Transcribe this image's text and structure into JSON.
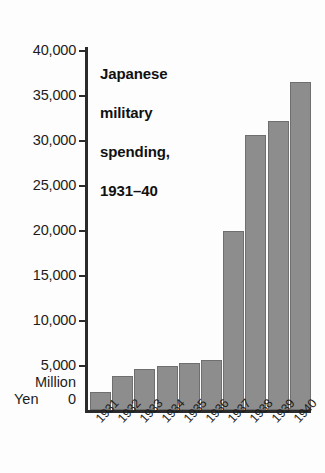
{
  "chart_data": {
    "type": "bar",
    "title": "Japanese military spending, 1931–40",
    "title_lines": [
      "Japanese",
      "military",
      "spending,",
      "1931–40"
    ],
    "xlabel": "",
    "ylabel": "Million Yen",
    "ylabel_lines": [
      "Million",
      "Yen"
    ],
    "categories": [
      "1931",
      "1932",
      "1933",
      "1934",
      "1935",
      "1936",
      "1937",
      "1938",
      "1939",
      "1940"
    ],
    "values": [
      2000,
      3800,
      4600,
      4900,
      5200,
      5600,
      19900,
      30600,
      32100,
      36400
    ],
    "series": [
      {
        "name": "Japanese military spending",
        "values": [
          2000,
          3800,
          4600,
          4900,
          5200,
          5600,
          19900,
          30600,
          32100,
          36400
        ]
      }
    ],
    "ylim": [
      0,
      40000
    ],
    "y_ticks": [
      0,
      5000,
      10000,
      15000,
      20000,
      25000,
      30000,
      35000,
      40000
    ],
    "y_tick_labels": [
      "0",
      "5,000",
      "10,000",
      "15,000",
      "20,000",
      "25,000",
      "30,000",
      "35,000",
      "40,000"
    ],
    "grid": false,
    "legend": null,
    "bar_color": "#8d8d8d",
    "bar_border_color": "#6f6f6f",
    "axis_color": "#2b2b2b",
    "text_color": "#1c1c1c",
    "background_color": "#fdfdfd"
  },
  "axis": {
    "tick_0": "0",
    "tick_5000": "5,000",
    "tick_10000": "10,000",
    "tick_15000": "15,000",
    "tick_20000": "20,000",
    "tick_25000": "25,000",
    "tick_30000": "30,000",
    "tick_35000": "35,000",
    "tick_40000": "40,000",
    "unit_line1": "Million",
    "unit_line2": "Yen",
    "zero_label": "0"
  },
  "title": {
    "line1": "Japanese",
    "line2": "military",
    "line3": "spending,",
    "line4": "1931–40"
  },
  "years": {
    "y1931": "1931",
    "y1932": "1932",
    "y1933": "1933",
    "y1934": "1934",
    "y1935": "1935",
    "y1936": "1936",
    "y1937": "1937",
    "y1938": "1938",
    "y1939": "1939",
    "y1940": "1940"
  }
}
